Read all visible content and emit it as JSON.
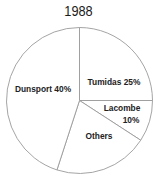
{
  "chart_data": {
    "type": "pie",
    "title": "1988",
    "slices": [
      {
        "name": "Tumidas",
        "value": 25,
        "label_lines": [
          "Tumidas 25%"
        ],
        "start_deg": 0,
        "end_deg": 90
      },
      {
        "name": "Lacombe",
        "value": 10,
        "label_lines": [
          "Lacombe",
          "10%"
        ],
        "start_deg": 90,
        "end_deg": 123
      },
      {
        "name": "Others",
        "value": 25,
        "label_lines": [
          "Others"
        ],
        "start_deg": 123,
        "end_deg": 198
      },
      {
        "name": "Dunsport",
        "value": 40,
        "label_lines": [
          "Dunsport 40%"
        ],
        "start_deg": 198,
        "end_deg": 360
      }
    ],
    "legend": "none",
    "colors": {
      "fill": "#ffffff",
      "stroke": "#9a9a9a",
      "text": "#222222"
    }
  }
}
